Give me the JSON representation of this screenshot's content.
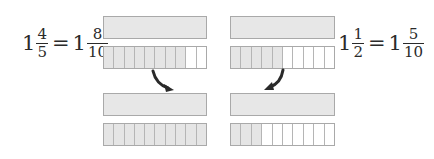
{
  "left": {
    "equation": {
      "lhs": {
        "whole": "1",
        "numerator": "4",
        "denominator": "5"
      },
      "equals": "=",
      "rhs": {
        "whole": "1",
        "numerator": "8",
        "denominator": "10"
      }
    },
    "top_whole_bar": {
      "shaded": true
    },
    "top_segmented_bar": {
      "segments": 10,
      "shaded": 8
    },
    "bottom_whole_bar": {
      "shaded": true
    },
    "bottom_segmented_bar": {
      "segments": 10,
      "shaded": 10
    },
    "arrow": "curved-arrow-down-right"
  },
  "right": {
    "equation": {
      "lhs": {
        "whole": "1",
        "numerator": "1",
        "denominator": "2"
      },
      "equals": "=",
      "rhs": {
        "whole": "1",
        "numerator": "5",
        "denominator": "10"
      }
    },
    "top_whole_bar": {
      "shaded": true
    },
    "top_segmented_bar": {
      "segments": 10,
      "shaded": 5
    },
    "bottom_whole_bar": {
      "shaded": true
    },
    "bottom_segmented_bar": {
      "segments": 10,
      "shaded": 3
    },
    "arrow": "curved-arrow-down-left"
  },
  "colors": {
    "shaded": "#e5e5e5",
    "border": "#a9a9a9",
    "arrow": "#2a2a2a",
    "text": "#2a2a2a"
  }
}
